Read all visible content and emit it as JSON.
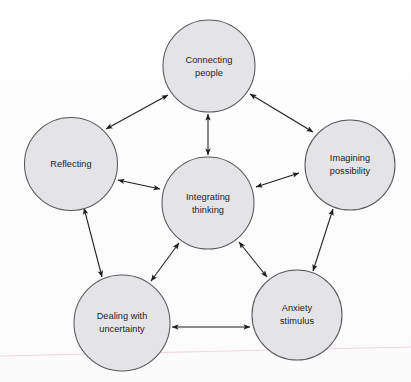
{
  "diagram": {
    "type": "node-link-diagram",
    "background_color": "#fdfdfd",
    "node_fill_color": "#e4e4e7",
    "node_stroke_color": "#58585c",
    "connector_color": "#1d1d1d",
    "scan_artifact_color": "#e8c8de",
    "nodes": [
      {
        "id": "connecting-people",
        "label_line1": "Connecting",
        "label_line2": "people",
        "cx": 209,
        "cy": 66,
        "r": 46
      },
      {
        "id": "reflecting",
        "label_line1": "Reflecting",
        "label_line2": "",
        "cx": 71,
        "cy": 164,
        "r": 46.5
      },
      {
        "id": "imagining-possibility",
        "label_line1": "Imagining",
        "label_line2": "possibility",
        "cx": 350,
        "cy": 165,
        "r": 45
      },
      {
        "id": "integrating-thinking",
        "label_line1": "Integrating",
        "label_line2": "thinking",
        "cx": 208,
        "cy": 203,
        "r": 46
      },
      {
        "id": "dealing-with-uncertainty",
        "label_line1": "Dealing with",
        "label_line2": "uncertainty",
        "cx": 122,
        "cy": 323,
        "r": 48
      },
      {
        "id": "anxiety-stimulus",
        "label_line1": "Anxiety",
        "label_line2": "stimulus",
        "cx": 297,
        "cy": 315,
        "r": 45
      }
    ],
    "connectors": [
      {
        "id": "reflecting--connecting-people",
        "from": "reflecting",
        "to": "connecting-people",
        "arrow": "double"
      },
      {
        "id": "connecting-people--imagining-possibility",
        "from": "connecting-people",
        "to": "imagining-possibility",
        "arrow": "double"
      },
      {
        "id": "reflecting--dealing-with-uncertainty",
        "from": "reflecting",
        "to": "dealing-with-uncertainty",
        "arrow": "double"
      },
      {
        "id": "imagining-possibility--anxiety-stimulus",
        "from": "imagining-possibility",
        "to": "anxiety-stimulus",
        "arrow": "double"
      },
      {
        "id": "dealing-with-uncertainty--anxiety-stimulus",
        "from": "dealing-with-uncertainty",
        "to": "anxiety-stimulus",
        "arrow": "double"
      },
      {
        "id": "connecting-people--integrating-thinking",
        "from": "connecting-people",
        "to": "integrating-thinking",
        "arrow": "double"
      },
      {
        "id": "reflecting--integrating-thinking",
        "from": "reflecting",
        "to": "integrating-thinking",
        "arrow": "double"
      },
      {
        "id": "imagining-possibility--integrating-thinking",
        "from": "imagining-possibility",
        "to": "integrating-thinking",
        "arrow": "double"
      },
      {
        "id": "dealing-with-uncertainty--integrating-thinking",
        "from": "dealing-with-uncertainty",
        "to": "integrating-thinking",
        "arrow": "double"
      },
      {
        "id": "anxiety-stimulus--integrating-thinking",
        "from": "anxiety-stimulus",
        "to": "integrating-thinking",
        "arrow": "double"
      }
    ]
  }
}
